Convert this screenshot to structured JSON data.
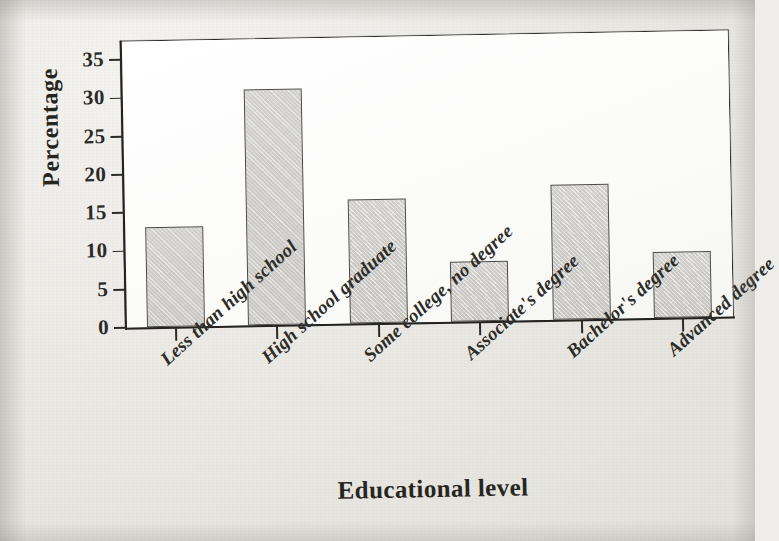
{
  "figure": {
    "kind": "scanned-textbook-bar-chart",
    "background_color": "#e8e7e2",
    "plot_background_color": "#fdfdfc",
    "ink_color": "#26261f",
    "bar_fill_color": "#cdccc8",
    "bar_border_color": "#4a4a47"
  },
  "chart_data": {
    "type": "bar",
    "title": "",
    "xlabel": "Educational level",
    "ylabel": "Percentage",
    "categories": [
      "Less than high school",
      "High school graduate",
      "Some college, no degree",
      "Associate's degree",
      "Bachelor's degree",
      "Advanced degree"
    ],
    "values": [
      13.1,
      30.9,
      16.2,
      7.8,
      17.6,
      8.6
    ],
    "ylim": [
      0,
      37.5
    ],
    "yticks": [
      0,
      5,
      10,
      15,
      20,
      25,
      30,
      35
    ],
    "ytick_labels": [
      "0",
      "5",
      "10",
      "15",
      "20",
      "25",
      "30",
      "35"
    ],
    "grid": false,
    "legend": false,
    "legend_position": "none",
    "bar_orientation": "vertical",
    "value_unit": "%"
  }
}
